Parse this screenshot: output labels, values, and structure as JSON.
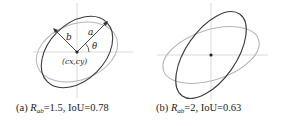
{
  "colors": {
    "dark_ellipse": "#3a3a3a",
    "light_ellipse": "#b0b0b0",
    "axes": "#c8c8c8",
    "text": "#222222"
  },
  "panel_a": {
    "labels": {
      "a": "a",
      "b": "b",
      "theta": "θ",
      "center": "(cx,cy)"
    },
    "caption": {
      "prefix": "(a) ",
      "R": "R",
      "sub": "ab",
      "rest": "=1.5, IoU=0.78"
    },
    "ratio": 1.5,
    "iou": 0.78
  },
  "panel_b": {
    "caption": {
      "prefix": "(b) ",
      "R": "R",
      "sub": "ab",
      "rest": "=2, IoU=0.63"
    },
    "ratio": 2,
    "iou": 0.63
  }
}
